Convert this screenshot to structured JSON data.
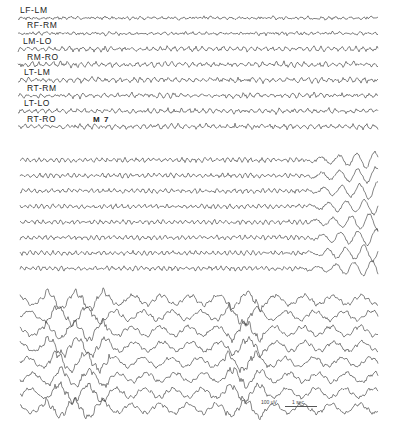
{
  "figure": {
    "type": "EEG tracing",
    "channels": [
      "LF-LM",
      "RF-RM",
      "LM-LO",
      "RM-RO",
      "LT-LM",
      "RT-RM",
      "LT-LO",
      "RT-RO"
    ],
    "marker": "M 7",
    "calibration": {
      "amplitude": "100 µV",
      "time": "1 sec"
    },
    "panels": [
      {
        "id": "top",
        "rows": 8,
        "y_start": 18,
        "row_spacing": 15.5,
        "x_start": 18,
        "x_end": 378,
        "style": "low-amplitude fast"
      },
      {
        "id": "middle",
        "rows": 8,
        "y_start": 160,
        "row_spacing": 15.5,
        "x_start": 20,
        "x_end": 378,
        "style": "fast activity evolving to high-amplitude discharge at right"
      },
      {
        "id": "bottom",
        "rows": 8,
        "y_start": 300,
        "row_spacing": 15.5,
        "x_start": 20,
        "x_end": 378,
        "style": "high-amplitude rhythmic slow waves with spikes"
      }
    ],
    "trace_color": "#333333",
    "background": "#ffffff"
  }
}
